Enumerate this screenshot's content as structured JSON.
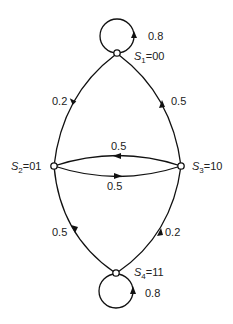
{
  "diagram": {
    "type": "state-transition",
    "nodes": [
      {
        "id": "S1",
        "name": "S",
        "sub": "1",
        "code": "=00"
      },
      {
        "id": "S2",
        "name": "S",
        "sub": "2",
        "code": "=01"
      },
      {
        "id": "S3",
        "name": "S",
        "sub": "3",
        "code": "=10"
      },
      {
        "id": "S4",
        "name": "S",
        "sub": "4",
        "code": "=11"
      }
    ],
    "edges": [
      {
        "from": "S1",
        "to": "S1",
        "label": "0.8"
      },
      {
        "from": "S1",
        "to": "S2",
        "label": "0.2"
      },
      {
        "from": "S3",
        "to": "S1",
        "label": "0.5"
      },
      {
        "from": "S3",
        "to": "S2",
        "label": "0.5"
      },
      {
        "from": "S2",
        "to": "S3",
        "label": "0.5"
      },
      {
        "from": "S2",
        "to": "S4",
        "label": "0.5"
      },
      {
        "from": "S4",
        "to": "S3",
        "label": "0.2"
      },
      {
        "from": "S4",
        "to": "S4",
        "label": "0.8"
      }
    ]
  }
}
